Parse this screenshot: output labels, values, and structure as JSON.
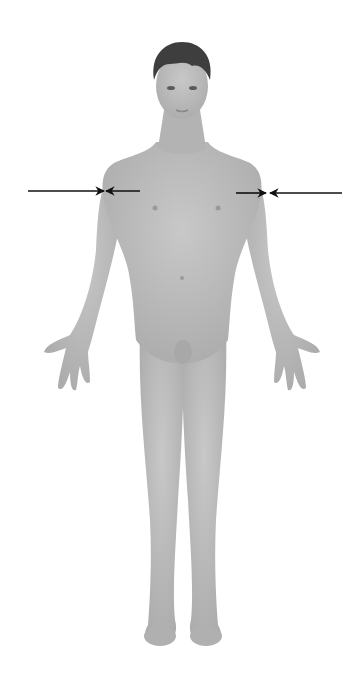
{
  "figure": {
    "skin_color": "#b9b9b9",
    "skin_shade": "#a4a4a4",
    "hair_color": "#3e3e3e",
    "background": "#ffffff"
  },
  "arrows": [
    {
      "name": "left-outer-arrow",
      "from_x": 28,
      "to_x": 104,
      "y": 191,
      "direction": "right"
    },
    {
      "name": "left-inner-arrow",
      "from_x": 140,
      "to_x": 106,
      "y": 191,
      "direction": "left"
    },
    {
      "name": "right-inner-arrow",
      "from_x": 236,
      "to_x": 266,
      "y": 193,
      "direction": "right"
    },
    {
      "name": "right-outer-arrow",
      "from_x": 342,
      "to_x": 270,
      "y": 193,
      "direction": "left"
    }
  ],
  "arrow_color": "#111111"
}
